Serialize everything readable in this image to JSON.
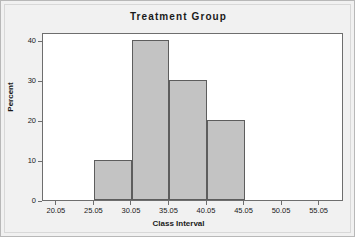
{
  "chart_data": {
    "type": "bar",
    "title": "Treatment Group",
    "xlabel": "Class Interval",
    "ylabel": "Percent",
    "categories": [
      "25.05-30.05",
      "30.05-35.05",
      "35.05-40.05",
      "40.05-45.05"
    ],
    "bin_edges": [
      25.05,
      30.05,
      35.05,
      40.05,
      45.05
    ],
    "values": [
      10,
      40,
      30,
      20
    ],
    "xlim": [
      18.2,
      58.3
    ],
    "ylim": [
      0,
      42
    ],
    "x_ticks": [
      20.05,
      25.05,
      30.05,
      35.05,
      40.05,
      45.05,
      50.05,
      55.05
    ],
    "x_tick_labels": [
      "20.05",
      "25.05",
      "30.05",
      "35.05",
      "40.05",
      "45.05",
      "50.05",
      "55.05"
    ],
    "y_ticks": [
      0,
      10,
      20,
      30,
      40
    ],
    "y_tick_labels": [
      "0",
      "10",
      "20",
      "30",
      "40"
    ],
    "grid": false,
    "legend": false,
    "bar_fill_color": "#c3c3c3",
    "bar_edge_color": "#5d5d5d",
    "plot_background": "#ffffff",
    "figure_background": "#f1f1f1",
    "axis_color": "#6e6e6e"
  }
}
